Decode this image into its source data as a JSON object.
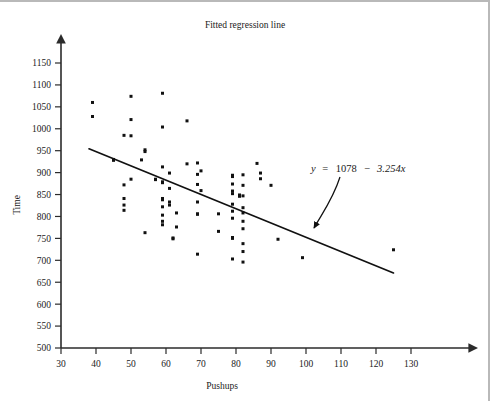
{
  "chart_data": {
    "type": "scatter",
    "title": "Fitted regression line",
    "xlabel": "Pushups",
    "ylabel": "Time",
    "xlim": [
      30,
      137
    ],
    "ylim": [
      500,
      1175
    ],
    "grid": false,
    "legend": null,
    "xticks": [
      30,
      40,
      50,
      60,
      70,
      80,
      90,
      100,
      110,
      120,
      130
    ],
    "yticks": [
      500,
      550,
      600,
      650,
      700,
      750,
      800,
      850,
      900,
      950,
      1000,
      1050,
      1100,
      1150
    ],
    "annotation": {
      "text": "y  =  1078  −  3.254x",
      "y_symbol": "y",
      "equals": "=",
      "intercept": "1078",
      "minus": "−",
      "slope_term": "3.254x",
      "points_to": "regression-line"
    },
    "fit": {
      "equation": "y = 1078 - 3.254x",
      "intercept": 1078,
      "slope": -3.254,
      "x_start": 38,
      "x_end": 125,
      "y_start": 954.3,
      "y_end": 671.2
    },
    "series": [
      {
        "name": "observations",
        "marker": "square",
        "color": "#111111",
        "points": [
          [
            39,
            1060
          ],
          [
            39,
            1028
          ],
          [
            45,
            930
          ],
          [
            45,
            928
          ],
          [
            48,
            985
          ],
          [
            48,
            872
          ],
          [
            48,
            841
          ],
          [
            48,
            826
          ],
          [
            48,
            814
          ],
          [
            50,
            1074
          ],
          [
            50,
            1021
          ],
          [
            50,
            984
          ],
          [
            50,
            885
          ],
          [
            53,
            929
          ],
          [
            54,
            952
          ],
          [
            54,
            948
          ],
          [
            54,
            763
          ],
          [
            57,
            885
          ],
          [
            57,
            884
          ],
          [
            59,
            1081
          ],
          [
            59,
            1004
          ],
          [
            59,
            913
          ],
          [
            59,
            879
          ],
          [
            59,
            877
          ],
          [
            59,
            841
          ],
          [
            59,
            838
          ],
          [
            59,
            822
          ],
          [
            59,
            803
          ],
          [
            59,
            789
          ],
          [
            59,
            781
          ],
          [
            61,
            899
          ],
          [
            61,
            864
          ],
          [
            61,
            833
          ],
          [
            61,
            826
          ],
          [
            62,
            751
          ],
          [
            62,
            749
          ],
          [
            63,
            808
          ],
          [
            63,
            776
          ],
          [
            66,
            1018
          ],
          [
            66,
            920
          ],
          [
            69,
            922
          ],
          [
            69,
            896
          ],
          [
            69,
            873
          ],
          [
            69,
            833
          ],
          [
            69,
            806
          ],
          [
            69,
            805
          ],
          [
            69,
            714
          ],
          [
            70,
            904
          ],
          [
            70,
            859
          ],
          [
            75,
            806
          ],
          [
            75,
            766
          ],
          [
            79,
            894
          ],
          [
            79,
            891
          ],
          [
            79,
            874
          ],
          [
            79,
            858
          ],
          [
            79,
            852
          ],
          [
            79,
            828
          ],
          [
            79,
            812
          ],
          [
            79,
            796
          ],
          [
            79,
            752
          ],
          [
            79,
            750
          ],
          [
            79,
            703
          ],
          [
            81,
            849
          ],
          [
            81,
            846
          ],
          [
            82,
            895
          ],
          [
            82,
            871
          ],
          [
            82,
            847
          ],
          [
            82,
            820
          ],
          [
            82,
            808
          ],
          [
            82,
            789
          ],
          [
            82,
            772
          ],
          [
            82,
            738
          ],
          [
            82,
            720
          ],
          [
            82,
            696
          ],
          [
            86,
            921
          ],
          [
            87,
            899
          ],
          [
            87,
            886
          ],
          [
            90,
            871
          ],
          [
            92,
            748
          ],
          [
            99,
            706
          ],
          [
            125,
            724
          ]
        ]
      }
    ]
  }
}
